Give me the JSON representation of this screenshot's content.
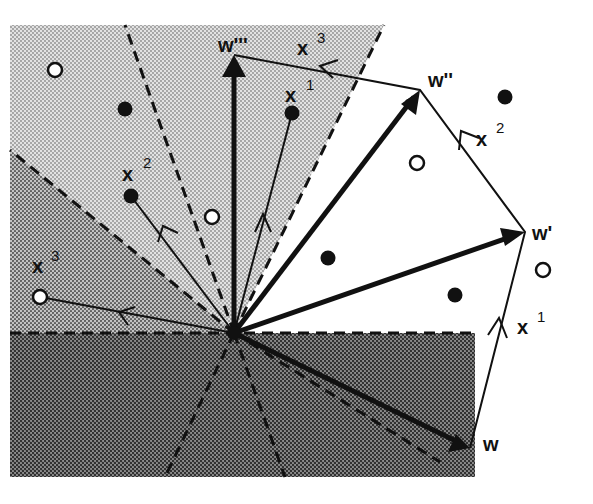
{
  "figure": {
    "colors": {
      "background": "#ffffff",
      "light_region": "#cfcfcf",
      "mid_region": "#a9a9a9",
      "dark_region": "#6e6e6e",
      "ink": "#111111"
    },
    "origin": [
      234,
      333
    ],
    "weight_vectors": [
      {
        "name": "w",
        "label": "w",
        "primes": "",
        "end": [
          470,
          448
        ],
        "label_pos": [
          483,
          450
        ]
      },
      {
        "name": "w-prime",
        "label": "w",
        "primes": "'",
        "end": [
          525,
          232
        ],
        "label_pos": [
          533,
          240
        ]
      },
      {
        "name": "w-double-prime",
        "label": "w",
        "primes": "''",
        "end": [
          420,
          90
        ],
        "label_pos": [
          430,
          85
        ]
      },
      {
        "name": "w-triple-prime",
        "label": "w",
        "primes": "'''",
        "end": [
          234,
          55
        ],
        "label_pos": [
          220,
          52
        ]
      }
    ],
    "update_steps": [
      {
        "name": "step-x1",
        "label": "x",
        "sup": "1",
        "from": [
          470,
          448
        ],
        "to": [
          525,
          232
        ],
        "label_pos": [
          517,
          334
        ]
      },
      {
        "name": "step-x2",
        "label": "x",
        "sup": "2",
        "from": [
          525,
          232
        ],
        "to": [
          420,
          90
        ],
        "label_pos": [
          477,
          140
        ]
      },
      {
        "name": "step-x3",
        "label": "x",
        "sup": "3",
        "from": [
          420,
          90
        ],
        "to": [
          234,
          55
        ],
        "label_pos": [
          297,
          53
        ]
      }
    ],
    "input_vectors": [
      {
        "name": "input-x1",
        "label": "x",
        "sup": "1",
        "end": [
          292,
          113
        ],
        "label_pos": [
          288,
          102
        ],
        "filled": true
      },
      {
        "name": "input-x2",
        "label": "x",
        "sup": "2",
        "end": [
          131,
          196
        ],
        "label_pos": [
          124,
          180
        ],
        "filled": true
      },
      {
        "name": "input-x3",
        "label": "x",
        "sup": "3",
        "end": [
          40,
          297
        ],
        "label_pos": [
          34,
          273
        ],
        "filled": false
      }
    ],
    "points": {
      "open": [
        [
          55,
          70
        ],
        [
          212,
          217
        ],
        [
          417,
          163
        ],
        [
          543,
          270
        ]
      ],
      "filled": [
        [
          125,
          109
        ],
        [
          328,
          258
        ],
        [
          455,
          295
        ],
        [
          505,
          97
        ]
      ]
    },
    "labels": {
      "w": "w",
      "x": "x",
      "s1": "1",
      "s2": "2",
      "s3": "3",
      "p1": "'",
      "p2": "''",
      "p3": "'''"
    }
  }
}
